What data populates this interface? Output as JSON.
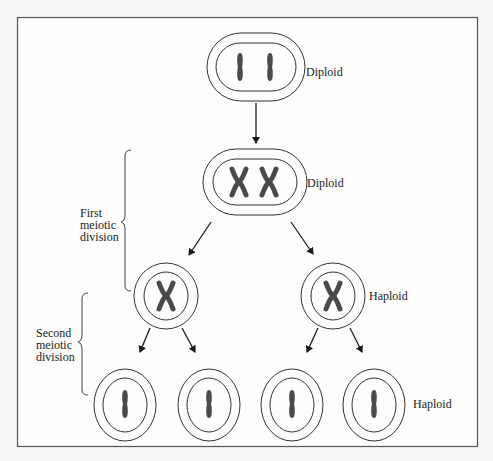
{
  "diagram": {
    "colors": {
      "background": "#f7f7f5",
      "frame": "#555555",
      "membrane": "#333333",
      "chromosome": "#4a4a4a",
      "arrow": "#1a1a1a",
      "text": "#222222"
    },
    "stages": [
      {
        "id": "parent-cell",
        "ploidy_label": "Diploid",
        "chromosomes": "2 unreplicated (I I)"
      },
      {
        "id": "replicated-cell",
        "ploidy_label": "Diploid",
        "chromosomes": "2 replicated (X X)"
      },
      {
        "id": "first-division-products",
        "ploidy_label": "Haploid",
        "cells": 2,
        "chromosomes_per_cell": "1 replicated (X)"
      },
      {
        "id": "second-division-products",
        "ploidy_label": "Haploid",
        "cells": 4,
        "chromosomes_per_cell": "1 unreplicated (I)"
      }
    ],
    "brackets": {
      "first": {
        "lines": [
          "First",
          "meiotic",
          "division"
        ]
      },
      "second": {
        "lines": [
          "Second",
          "meiotic",
          "division"
        ]
      }
    }
  }
}
